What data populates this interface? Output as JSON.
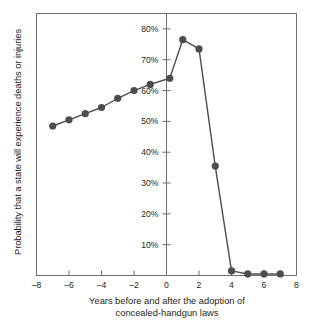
{
  "chart_data": {
    "type": "line",
    "title": "",
    "xlabel_line1": "Years before and after the adoption of",
    "xlabel_line2": "concealed-handgun laws",
    "ylabel": "Probability that a state will experience deaths or injuries",
    "xlim": [
      -8,
      8
    ],
    "ylim": [
      0,
      85
    ],
    "xticks": [
      -8,
      -6,
      -4,
      -2,
      0,
      2,
      4,
      6,
      8
    ],
    "xtick_labels": [
      "–8",
      "–6",
      "–4",
      "–2",
      "0",
      "2",
      "4",
      "6",
      "8"
    ],
    "yticks": [
      10,
      20,
      30,
      40,
      50,
      60,
      70,
      80
    ],
    "ytick_labels": [
      "10%",
      "20%",
      "30%",
      "40%",
      "50%",
      "60%",
      "70%",
      "80%"
    ],
    "grid": false,
    "legend": "none",
    "y_axis_position_x": 0,
    "series": [
      {
        "name": "Probability of deaths or injuries",
        "marker": "circle",
        "color": "#4d4d4d",
        "x": [
          -7,
          -6,
          -5,
          -4,
          -3,
          -2,
          -1,
          0.2,
          1,
          2,
          3,
          4,
          5,
          6,
          7
        ],
        "values": [
          48.5,
          50.5,
          52.5,
          54.5,
          57.5,
          60,
          62,
          64,
          76.5,
          73.5,
          35.5,
          1.5,
          0.5,
          0.5,
          0.5
        ]
      }
    ]
  }
}
